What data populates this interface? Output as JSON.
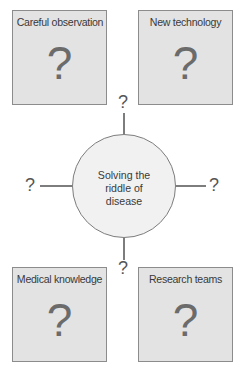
{
  "diagram": {
    "center": {
      "label_lines": [
        "Solving the",
        "riddle of",
        "disease"
      ]
    },
    "boxes": [
      {
        "title": "Careful observation",
        "mark": "?"
      },
      {
        "title": "New technology",
        "mark": "?"
      },
      {
        "title": "Medical knowledge",
        "mark": "?"
      },
      {
        "title": "Research teams",
        "mark": "?"
      }
    ],
    "spokes": {
      "top": "?",
      "left": "?",
      "right": "?",
      "bottom": "?"
    }
  },
  "colors": {
    "box_fill": "#e3e3e3",
    "box_border": "#8c8c8c",
    "circle_fill": "#f1f1f1",
    "line": "#7d7d7d",
    "text": "#3a3a3a"
  }
}
